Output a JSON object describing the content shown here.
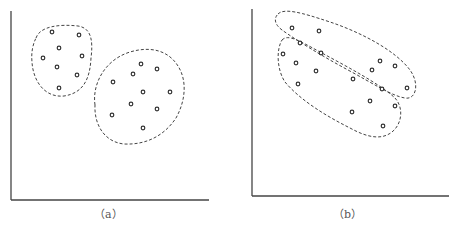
{
  "panels": [
    {
      "id": "a",
      "caption": "（a）",
      "description": "Two compact, well-separated clusters",
      "clusters": [
        {
          "name": "cluster-1",
          "points": [
            [
              52,
              32
            ],
            [
              79,
              35
            ],
            [
              59,
              48
            ],
            [
              43,
              58
            ],
            [
              82,
              56
            ],
            [
              57,
              67
            ],
            [
              77,
              75
            ],
            [
              59,
              88
            ]
          ]
        },
        {
          "name": "cluster-2",
          "points": [
            [
              141,
              64
            ],
            [
              157,
              69
            ],
            [
              133,
              74
            ],
            [
              113,
              82
            ],
            [
              143,
              92
            ],
            [
              170,
              92
            ],
            [
              131,
              104
            ],
            [
              157,
              109
            ],
            [
              112,
              115
            ],
            [
              143,
              128
            ]
          ]
        }
      ]
    },
    {
      "id": "b",
      "caption": "（b）",
      "description": "Two elongated, overlapping-direction clusters",
      "clusters": [
        {
          "name": "cluster-upper",
          "points": [
            [
              292,
              28
            ],
            [
              319,
              31
            ],
            [
              300,
              43
            ],
            [
              321,
              53
            ],
            [
              380,
              61
            ],
            [
              395,
              66
            ],
            [
              372,
              70
            ],
            [
              407,
              88
            ]
          ]
        },
        {
          "name": "cluster-lower",
          "points": [
            [
              283,
              54
            ],
            [
              296,
              63
            ],
            [
              316,
              71
            ],
            [
              298,
              84
            ],
            [
              353,
              79
            ],
            [
              382,
              89
            ],
            [
              370,
              101
            ],
            [
              395,
              106
            ],
            [
              352,
              112
            ],
            [
              383,
              126
            ]
          ]
        }
      ]
    }
  ]
}
